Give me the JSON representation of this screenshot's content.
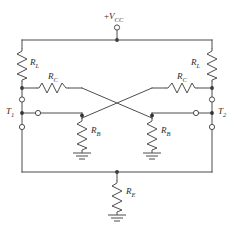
{
  "figure": {
    "kind": "circuit-schematic",
    "line_color": "#4d4d4d",
    "node_color": "#333333",
    "background": "#ffffff",
    "text_color": "#2b2b2b"
  },
  "labels": {
    "supply": {
      "sign": "+",
      "symbol": "V",
      "subscript": "CC",
      "text": "+VCC"
    },
    "load_left": {
      "symbol": "R",
      "subscript": "L",
      "text": "RL"
    },
    "load_right": {
      "symbol": "R",
      "subscript": "L",
      "text": "RL"
    },
    "coupling_left": {
      "symbol": "R",
      "subscript": "C",
      "text": "RC"
    },
    "coupling_right": {
      "symbol": "R",
      "subscript": "C",
      "text": "RC"
    },
    "base_left": {
      "symbol": "R",
      "subscript": "B",
      "text": "RB"
    },
    "base_right": {
      "symbol": "R",
      "subscript": "B",
      "text": "RB"
    },
    "emitter": {
      "symbol": "R",
      "subscript": "E",
      "text": "RE"
    },
    "terminal_left": {
      "symbol": "T",
      "subscript": "1",
      "text": "T1"
    },
    "terminal_right": {
      "symbol": "T",
      "subscript": "2",
      "text": "T2"
    }
  },
  "components": [
    {
      "id": "R_L_left",
      "type": "resistor",
      "orientation": "vertical",
      "label": "RL"
    },
    {
      "id": "R_L_right",
      "type": "resistor",
      "orientation": "vertical",
      "label": "RL"
    },
    {
      "id": "R_C_left",
      "type": "resistor",
      "orientation": "horizontal",
      "label": "RC"
    },
    {
      "id": "R_C_right",
      "type": "resistor",
      "orientation": "horizontal",
      "label": "RC"
    },
    {
      "id": "R_B_left",
      "type": "resistor",
      "orientation": "vertical",
      "label": "RB"
    },
    {
      "id": "R_B_right",
      "type": "resistor",
      "orientation": "vertical",
      "label": "RB"
    },
    {
      "id": "R_E",
      "type": "resistor",
      "orientation": "vertical",
      "label": "RE"
    }
  ],
  "terminals": [
    {
      "id": "vcc-terminal",
      "label": "+VCC",
      "kind": "open-circle"
    },
    {
      "id": "t1-upper-terminal",
      "label": "",
      "kind": "open-circle"
    },
    {
      "id": "t1-middle-terminal",
      "label": "T1",
      "kind": "open-circle"
    },
    {
      "id": "t1-lower-terminal",
      "label": "",
      "kind": "open-circle"
    },
    {
      "id": "t2-upper-terminal",
      "label": "",
      "kind": "open-circle"
    },
    {
      "id": "t2-middle-terminal",
      "label": "T2",
      "kind": "open-circle"
    },
    {
      "id": "t2-lower-terminal",
      "label": "",
      "kind": "open-circle"
    }
  ],
  "grounds": [
    {
      "id": "ground-base-left"
    },
    {
      "id": "ground-base-right"
    },
    {
      "id": "ground-emitter"
    }
  ]
}
